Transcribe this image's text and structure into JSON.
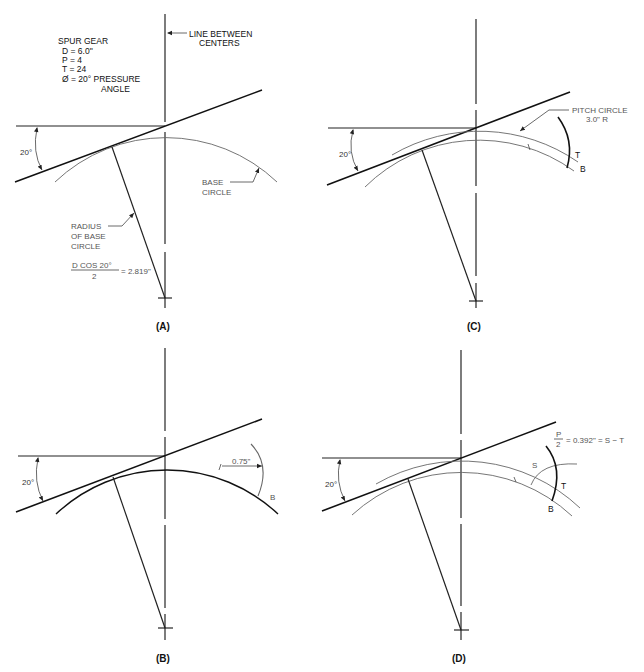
{
  "figure": {
    "panels": [
      {
        "id": "A",
        "caption": "(A)",
        "spec": {
          "title": "SPUR GEAR",
          "lines": [
            "D  =  6.0\"",
            "P  =  4",
            "T  =  24",
            "Ø  =  20° PRESSURE"
          ],
          "line_last": "ANGLE"
        },
        "line_between_centers": [
          "LINE BETWEEN",
          "CENTERS"
        ],
        "angle_label": "20°",
        "base_circle_label": [
          "BASE",
          "CIRCLE"
        ],
        "radius_label": [
          "RADIUS",
          "OF BASE",
          "CIRCLE"
        ],
        "formula_numerator": "D COS 20°",
        "formula_denominator": "2",
        "formula_result": "= 2.819\""
      },
      {
        "id": "B",
        "caption": "(B)",
        "angle_label": "20°",
        "dimension_label": "0.75\"",
        "point_label": "B"
      },
      {
        "id": "C",
        "caption": "(C)",
        "angle_label": "20°",
        "pitch_circle_label": [
          "PITCH CIRCLE",
          "3.0\" R"
        ],
        "point_t": "T",
        "point_b": "B"
      },
      {
        "id": "D",
        "caption": "(D)",
        "angle_label": "20°",
        "formula_numerator": "P",
        "formula_denominator": "2",
        "formula_result": "= 0.392\" = S − T",
        "point_s": "S",
        "point_t": "T",
        "point_b": "B"
      }
    ]
  }
}
